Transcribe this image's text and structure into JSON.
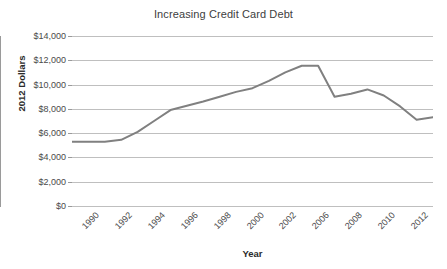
{
  "chart_data": {
    "type": "line",
    "title": "Increasing Credit Card Debt",
    "xlabel": "Year",
    "ylabel": "2012 Dollars",
    "xlim": [
      1990,
      2012
    ],
    "ylim": [
      0,
      14000
    ],
    "grid": true,
    "legend": "none",
    "y_ticks": [
      14000,
      12000,
      10000,
      8000,
      6000,
      4000,
      2000,
      0
    ],
    "y_tick_labels": [
      "$14,000",
      "$12,000",
      "$10,000",
      "$8,000",
      "$6,000",
      "$4,000",
      "$2,000",
      "$0"
    ],
    "x_tick_labels": [
      "1990",
      "1992",
      "1994",
      "1996",
      "1998",
      "2000",
      "2002",
      "2006",
      "2008",
      "2010",
      "2012"
    ],
    "series": [
      {
        "name": "Credit Card Debt",
        "color": "#808080",
        "x": [
          1990,
          1991,
          1992,
          1993,
          1994,
          1995,
          1996,
          1997,
          1998,
          1999,
          2000,
          2001,
          2002,
          2003,
          2004,
          2005,
          2006,
          2007,
          2008,
          2009,
          2010,
          2011,
          2012
        ],
        "values": [
          5300,
          5300,
          5300,
          5450,
          6100,
          7000,
          7900,
          8250,
          8600,
          9000,
          9400,
          9700,
          10300,
          11000,
          11550,
          11550,
          9000,
          9250,
          9600,
          9100,
          8200,
          7100,
          7300
        ]
      }
    ]
  },
  "chart": {
    "title": "Increasing Credit Card Debt",
    "y_axis_title": "2012 Dollars",
    "x_axis_title": "Year"
  },
  "colors": {
    "line": "#808080",
    "gridline": "#bfbfbf",
    "axis": "#9a9a9a",
    "text": "#404040",
    "background": "#ffffff"
  }
}
